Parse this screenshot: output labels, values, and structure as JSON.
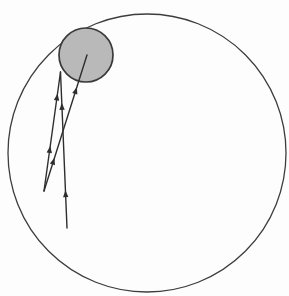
{
  "figure": {
    "canvas": {
      "width": 289,
      "height": 296,
      "background": "#fdfdfd"
    },
    "outer_circle": {
      "cx": 147,
      "cy": 153,
      "r": 139,
      "stroke": "#3d3d3d",
      "stroke_width": 1.3,
      "fill": "none"
    },
    "shaded_ball": {
      "cx": 86,
      "cy": 55,
      "r": 27,
      "stroke": "#3a3a3a",
      "stroke_width": 1.7,
      "fill": "#b9b9b9"
    },
    "trajectory": {
      "stroke": "#2e2e2e",
      "stroke_width": 1.4,
      "arrow_length": 7,
      "arrow_half_width": 2.7,
      "segments": [
        {
          "name": "vertical-ascent-line",
          "x1": 67,
          "y1": 228,
          "x2": 60.5,
          "y2": 72,
          "arrow_ts": [
            0.22,
            0.78
          ]
        },
        {
          "name": "left-chord-line",
          "x1": 44,
          "y1": 191,
          "x2": 60.5,
          "y2": 72,
          "arrow_ts": [
            0.35,
            0.79
          ]
        },
        {
          "name": "right-chord-line",
          "x1": 44,
          "y1": 191,
          "x2": 87,
          "y2": 55,
          "arrow_ts": [
            0.22,
            0.74
          ]
        }
      ]
    }
  }
}
